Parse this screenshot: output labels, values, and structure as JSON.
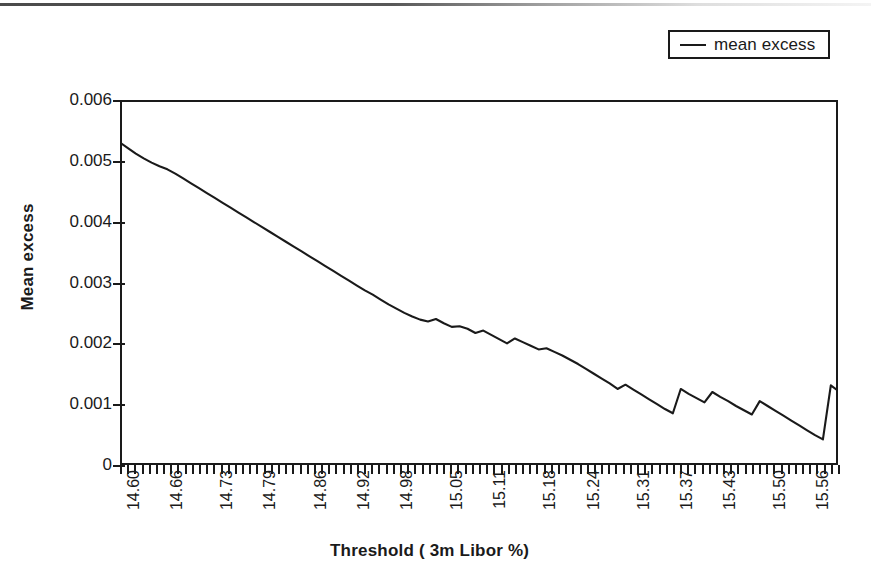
{
  "legend": {
    "position": "top-right",
    "entries": [
      {
        "label": "mean excess",
        "swatch": "line-swatch",
        "color": "#1a1a1a"
      }
    ]
  },
  "axes": {
    "y_title": "Mean excess",
    "x_title": "Threshold ( 3m Libor %)"
  },
  "chart_data": {
    "type": "line",
    "title": "",
    "subtitle": "",
    "xlabel": "Threshold ( 3m Libor %)",
    "ylabel": "Mean excess",
    "grid": false,
    "legend_position": "top-right",
    "xlim": [
      14.6,
      15.6
    ],
    "ylim": [
      0,
      0.006
    ],
    "ytick_labels": [
      "0",
      "0.001",
      "0.002",
      "0.003",
      "0.004",
      "0.005",
      "0.006"
    ],
    "ytick_values": [
      0,
      0.001,
      0.002,
      0.003,
      0.004,
      0.005,
      0.006
    ],
    "xtick_labels": [
      "14.60",
      "14.66",
      "14.73",
      "14.79",
      "14.86",
      "14.92",
      "14.98",
      "15.05",
      "15.11",
      "15.18",
      "15.24",
      "15.31",
      "15.37",
      "15.43",
      "15.50",
      "15.56"
    ],
    "xtick_values": [
      14.6,
      14.66,
      14.73,
      14.79,
      14.86,
      14.92,
      14.98,
      15.05,
      15.11,
      15.18,
      15.24,
      15.31,
      15.37,
      15.43,
      15.5,
      15.56
    ],
    "minor_ticks_per_label": 6,
    "series": [
      {
        "name": "mean excess",
        "color": "#1a1a1a",
        "x": [
          14.6,
          14.611,
          14.622,
          14.633,
          14.644,
          14.655,
          14.666,
          14.677,
          14.688,
          14.699,
          14.71,
          14.721,
          14.732,
          14.743,
          14.754,
          14.765,
          14.776,
          14.787,
          14.798,
          14.809,
          14.82,
          14.831,
          14.842,
          14.853,
          14.864,
          14.875,
          14.886,
          14.897,
          14.908,
          14.919,
          14.93,
          14.941,
          14.952,
          14.963,
          14.974,
          14.985,
          14.996,
          15.007,
          15.018,
          15.029,
          15.04,
          15.051,
          15.062,
          15.073,
          15.084,
          15.095,
          15.106,
          15.117,
          15.128,
          15.139,
          15.15,
          15.161,
          15.172,
          15.183,
          15.194,
          15.205,
          15.216,
          15.227,
          15.238,
          15.249,
          15.26,
          15.271,
          15.282,
          15.293,
          15.304,
          15.315,
          15.326,
          15.337,
          15.348,
          15.359,
          15.37,
          15.381,
          15.392,
          15.403,
          15.414,
          15.425,
          15.436,
          15.447,
          15.458,
          15.469,
          15.48,
          15.491,
          15.502,
          15.513,
          15.524,
          15.535,
          15.546,
          15.557,
          15.568,
          15.579,
          15.59,
          15.6
        ],
        "y": [
          0.0053,
          0.00521,
          0.00512,
          0.00504,
          0.00497,
          0.00491,
          0.00486,
          0.00479,
          0.00471,
          0.00463,
          0.00455,
          0.00447,
          0.00439,
          0.00431,
          0.00423,
          0.00415,
          0.00407,
          0.00399,
          0.00391,
          0.00383,
          0.00375,
          0.00367,
          0.00359,
          0.00351,
          0.00343,
          0.00335,
          0.00327,
          0.00319,
          0.00311,
          0.00303,
          0.00295,
          0.00287,
          0.0028,
          0.00272,
          0.00264,
          0.00257,
          0.0025,
          0.00244,
          0.00239,
          0.00236,
          0.0024,
          0.00233,
          0.00227,
          0.00228,
          0.00224,
          0.00217,
          0.00221,
          0.00214,
          0.00207,
          0.002,
          0.00208,
          0.00202,
          0.00196,
          0.0019,
          0.00192,
          0.00186,
          0.0018,
          0.00173,
          0.00166,
          0.00158,
          0.0015,
          0.00142,
          0.00134,
          0.00125,
          0.00132,
          0.00124,
          0.00116,
          0.00108,
          0.001,
          0.00092,
          0.00085,
          0.00125,
          0.00117,
          0.0011,
          0.00103,
          0.0012,
          0.00112,
          0.00105,
          0.00097,
          0.0009,
          0.00083,
          0.00105,
          0.00097,
          0.00089,
          0.00081,
          0.00073,
          0.00065,
          0.00057,
          0.00049,
          0.00042,
          0.00131,
          0.00122
        ]
      }
    ],
    "notable_points": [
      {
        "label": "start",
        "x": 14.6,
        "y": 0.0053
      },
      {
        "label": "large-spike-peak",
        "x": 15.37,
        "y": 0.00131
      },
      {
        "label": "deepest-trough",
        "x": 15.355,
        "y": 0.00041
      },
      {
        "label": "end",
        "x": 15.6,
        "y": 0.00029
      }
    ]
  }
}
